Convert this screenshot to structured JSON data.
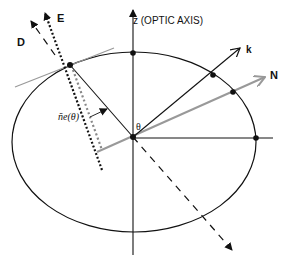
{
  "diagram": {
    "title": "",
    "labels": {
      "E": "E",
      "D": "D",
      "z_axis": "z (OPTIC AXIS)",
      "k": "k",
      "N": "N",
      "theta": "θ",
      "ne_theta": "ñe(θ)"
    },
    "colors": {
      "ink": "#111111",
      "gray": "#999999"
    },
    "elements": [
      "index ellipse",
      "optic axis z",
      "wave vector k",
      "ray/Poynting direction N (gray)",
      "field E (dotted)",
      "displacement D (dashed)",
      "tangent line at ellipse point",
      "extraordinary index ñe(θ)",
      "angle θ"
    ]
  }
}
